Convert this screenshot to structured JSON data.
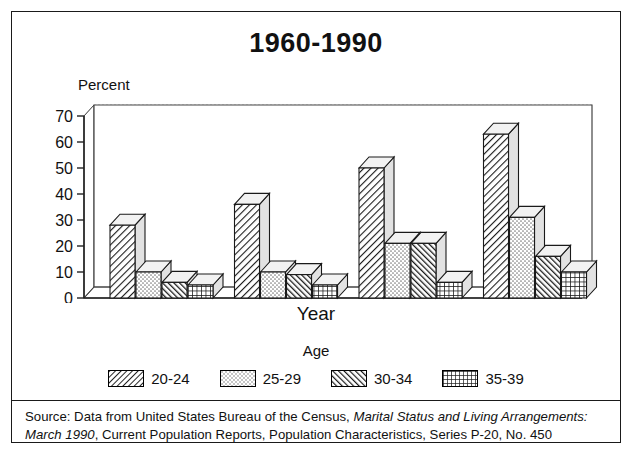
{
  "figure": {
    "title": "1960-1990",
    "xlabel": "Year",
    "ylabel": "Percent",
    "legend_title": "Age",
    "source_prefix": "Source: Data from United States Bureau of the Census, ",
    "source_italic_1": "Marital Status and Living Arrangements: March 1990",
    "source_suffix": ", Current Population Reports, Population Characteristics, Series P-20, No. 450"
  },
  "chart_data": {
    "type": "bar",
    "title": "1960-1990",
    "xlabel": "Year",
    "ylabel": "Percent",
    "legend_title": "Age",
    "legend_position": "bottom",
    "grid": true,
    "ylim": [
      0,
      70
    ],
    "yticks": [
      0,
      10,
      20,
      30,
      40,
      50,
      60,
      70
    ],
    "categories": [
      "1960",
      "1970",
      "1980",
      "1990"
    ],
    "series": [
      {
        "name": "20-24",
        "pattern": "dense-diagonal",
        "values": [
          28,
          36,
          50,
          63
        ]
      },
      {
        "name": "25-29",
        "pattern": "light-stipple",
        "values": [
          10,
          10,
          21,
          31
        ]
      },
      {
        "name": "30-34",
        "pattern": "dark-diagonal",
        "values": [
          6,
          9,
          21,
          16
        ]
      },
      {
        "name": "35-39",
        "pattern": "crosshatch-grid",
        "values": [
          5,
          5,
          6,
          10
        ]
      }
    ]
  },
  "ytick_labels": [
    "70",
    "60",
    "50",
    "40",
    "30",
    "20",
    "10",
    "0"
  ],
  "xtick_labels": [
    "1960",
    "1970",
    "1980",
    "1990"
  ],
  "legend_items": [
    {
      "label": "20-24"
    },
    {
      "label": "25-29"
    },
    {
      "label": "30-34"
    },
    {
      "label": "35-39"
    }
  ],
  "colors": {
    "ink": "#111111",
    "bar_fill": "#ffffff",
    "grid": "#b9b9b9",
    "top_face": "#f2f2f2",
    "side_face": "#e2e2e2"
  }
}
